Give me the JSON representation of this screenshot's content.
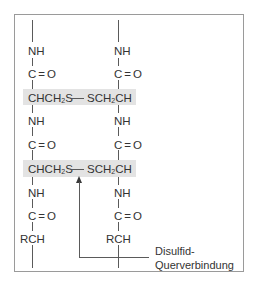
{
  "diagram": {
    "left_chain": {
      "units": [
        "NH",
        "C=O",
        "CHCH2S",
        "NH",
        "C=O",
        "CHCH2S",
        "NH",
        "C=O",
        "RCH"
      ]
    },
    "right_chain": {
      "units": [
        "NH",
        "C=O",
        "SCH2CH",
        "NH",
        "C=O",
        "SCH2CH",
        "NH",
        "C=O",
        "RCH"
      ]
    },
    "bridge_bond": "—",
    "text": {
      "nh": "NH",
      "c": "C",
      "eq": "=",
      "o": "O",
      "rch": "RCH",
      "chch": "CHCH",
      "s": "S",
      "sch": "SCH",
      "ch": "CH",
      "sub2": "2",
      "dash": "—"
    },
    "annotation": {
      "line1": "Disulfid-",
      "line2": "Querverbindung"
    },
    "colors": {
      "highlight_band": "#e3e3e3",
      "frame_border": "#9a9a9a",
      "line": "#5a5a5a"
    }
  },
  "caption": {
    "text": "Abbildung (partially cut off)"
  }
}
